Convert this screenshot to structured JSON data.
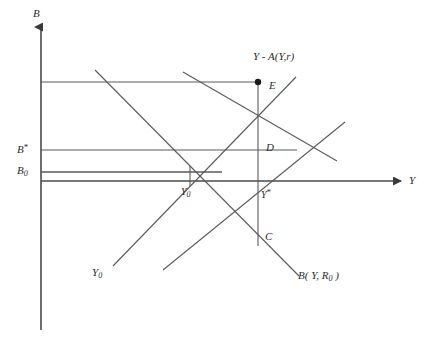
{
  "figure": {
    "type": "economics-diagram",
    "background": "#ffffff",
    "line_color": "#555555",
    "axis_color": "#444444",
    "text_color": "#2b2b2b",
    "width": 435,
    "height": 347
  },
  "axes": {
    "vertical": {
      "name": "B-axis",
      "label": "B",
      "x": 41,
      "top": 25,
      "bottom": 330
    },
    "horizontal": {
      "name": "Y-axis",
      "label": "Y",
      "y": 181,
      "left": 41,
      "right": 405
    }
  },
  "axis_values": [
    {
      "name": "B-star",
      "label_main": "B",
      "label_mark": "*",
      "y": 150
    },
    {
      "name": "B-zero",
      "label_main": "B",
      "label_sub": "0",
      "y": 172
    }
  ],
  "points": [
    {
      "name": "point-E",
      "label": "E",
      "x": 258,
      "y": 82,
      "filled": true
    },
    {
      "name": "point-D",
      "label": "D",
      "x": 258,
      "y": 147,
      "filled": false
    },
    {
      "name": "point-C",
      "label": "C",
      "x": 258,
      "y": 236,
      "filled": false
    },
    {
      "name": "point-Y0",
      "label_main": "Y",
      "label_sub": "0",
      "x": 190,
      "y": 172
    },
    {
      "name": "point-Y-star",
      "label_main": "Y",
      "label_mark": "*",
      "x": 258,
      "y": 181
    }
  ],
  "curve_labels": [
    {
      "name": "curve-label-YA",
      "text": "Y - A(Y,r)",
      "x": 255,
      "y": 57
    },
    {
      "name": "curve-label-Y0",
      "main": "Y",
      "sub": "0",
      "x": 96,
      "y": 272
    },
    {
      "name": "curve-label-B",
      "main": "B( Y, R",
      "sub": "0",
      "tail": " )",
      "x": 300,
      "y": 272
    }
  ],
  "horizontal_guides": [
    {
      "name": "guide-to-E",
      "y": 82,
      "x1": 41,
      "x2": 258
    },
    {
      "name": "guide-B-star",
      "y": 150,
      "x1": 41,
      "x2": 297
    },
    {
      "name": "guide-B-zero",
      "y": 172,
      "x1": 41,
      "x2": 220
    }
  ],
  "schedules": [
    {
      "name": "schedule-YA-upper",
      "slope": "down",
      "x1": 95,
      "y1": 70,
      "x2": 299,
      "y2": 276
    },
    {
      "name": "schedule-B-lower",
      "slope": "down",
      "x1": 183,
      "y1": 72,
      "x2": 337,
      "y2": 161
    },
    {
      "name": "schedule-Y0-line",
      "slope": "up",
      "x1": 113,
      "y1": 266,
      "x2": 296,
      "y2": 77
    },
    {
      "name": "schedule-Y-star-line",
      "slope": "up",
      "x1": 163,
      "y1": 270,
      "x2": 345,
      "y2": 122
    }
  ],
  "vertical_drop": {
    "name": "vertical-drop-E-C",
    "x": 258,
    "y1": 82,
    "y2": 245
  },
  "tick_drop": {
    "name": "tick-drop-Y0",
    "x": 190,
    "y1": 166,
    "y2": 185
  }
}
